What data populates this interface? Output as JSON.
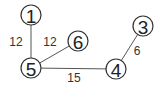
{
  "graph": {
    "nodes": [
      {
        "id": "1",
        "label": "1",
        "x": 31,
        "y": 15
      },
      {
        "id": "6",
        "label": "6",
        "x": 78,
        "y": 41
      },
      {
        "id": "5",
        "label": "5",
        "x": 31,
        "y": 68
      },
      {
        "id": "4",
        "label": "4",
        "x": 116,
        "y": 69
      },
      {
        "id": "3",
        "label": "3",
        "x": 143,
        "y": 26
      }
    ],
    "edges": [
      {
        "from": "1",
        "to": "5",
        "weight": "12",
        "lx": 16,
        "ly": 42
      },
      {
        "from": "5",
        "to": "6",
        "weight": "12",
        "lx": 50,
        "ly": 42
      },
      {
        "from": "5",
        "to": "4",
        "weight": "15",
        "lx": 74,
        "ly": 78
      },
      {
        "from": "4",
        "to": "3",
        "weight": "6",
        "lx": 137,
        "ly": 51
      }
    ]
  }
}
